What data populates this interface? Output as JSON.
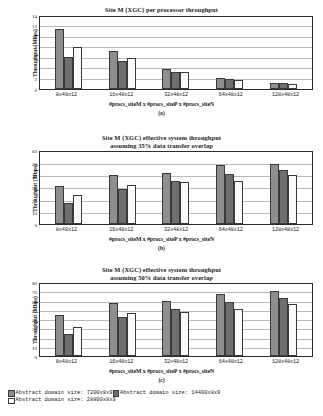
{
  "legend": {
    "items": [
      {
        "label": "Abstract domain size: 7200x8x9",
        "color": "#8e8e8e",
        "key": "series0"
      },
      {
        "label": "Abstract domain size: 14400x8x9",
        "color": "#6f6f6f",
        "key": "series1"
      },
      {
        "label": "Abstract domain size: 28800x8x9",
        "color": "#fbfbfb",
        "key": "series2"
      }
    ]
  },
  "panels": [
    {
      "caption": "(a)",
      "title_line1": "Site M (XGC) per processor throughput",
      "title_line2": ""
    },
    {
      "caption": "(b)",
      "title_line1": "Site M (XGC) effective system throughput",
      "title_line2": "assuming 35% data transfer overlap"
    },
    {
      "caption": "(c)",
      "title_line1": "Site M (XGC) effective system throughput",
      "title_line2": "assuming 50% data transfer overlap"
    }
  ],
  "chart_data": [
    {
      "type": "bar",
      "id": "a",
      "title": "Site M (XGC) per processor throughput",
      "subtitle": "",
      "caption": "(a)",
      "xlabel": "#procs_siteM x #procs_siteP x #procs_siteN",
      "ylabel": "Throughput (Mbps)",
      "categories": [
        "8x48x12",
        "16x48x12",
        "32x48x12",
        "64x48x12",
        "128x48x12"
      ],
      "ylim": [
        0,
        14
      ],
      "yticks": [
        0,
        2,
        4,
        6,
        8,
        10,
        12,
        14
      ],
      "grid": true,
      "legend_position": "below-figure",
      "series": [
        {
          "name": "Abstract domain size: 7200x8x9",
          "values": [
            11.6,
            7.3,
            3.9,
            2.1,
            1.1
          ]
        },
        {
          "name": "Abstract domain size: 14400x8x9",
          "values": [
            6.2,
            5.3,
            3.3,
            1.9,
            1.0
          ]
        },
        {
          "name": "Abstract domain size: 28800x8x9",
          "values": [
            8.0,
            6.0,
            3.2,
            1.7,
            0.9
          ]
        }
      ]
    },
    {
      "type": "bar",
      "id": "b",
      "title": "Site M (XGC) effective system throughput",
      "subtitle": "assuming 35% data transfer overlap",
      "caption": "(b)",
      "xlabel": "#procs_siteM x #procs_siteP x #procs_siteN",
      "ylabel": "Throughput (Mbps)",
      "categories": [
        "8x48x12",
        "16x48x12",
        "32x48x12",
        "64x48x12",
        "128x48x12"
      ],
      "ylim": [
        0,
        60
      ],
      "yticks": [
        0,
        10,
        20,
        30,
        40,
        50,
        60
      ],
      "grid": true,
      "legend_position": "below-figure",
      "series": [
        {
          "name": "Abstract domain size: 7200x8x9",
          "values": [
            32,
            41,
            42.5,
            49,
            50.5
          ]
        },
        {
          "name": "Abstract domain size: 14400x8x9",
          "values": [
            18,
            29.5,
            36,
            42,
            45
          ]
        },
        {
          "name": "Abstract domain size: 28800x8x9",
          "values": [
            24,
            33,
            35,
            36,
            41
          ]
        }
      ]
    },
    {
      "type": "bar",
      "id": "c",
      "title": "Site M (XGC) effective system throughput",
      "subtitle": "assuming 50% data transfer overlap",
      "caption": "(c)",
      "xlabel": "#procs_siteM x #procs_siteP x #procs_siteN",
      "ylabel": "Throughput (Mbps)",
      "categories": [
        "8x48x12",
        "16x48x12",
        "32x48x12",
        "64x48x12",
        "128x48x12"
      ],
      "ylim": [
        0,
        80
      ],
      "yticks": [
        0,
        10,
        20,
        30,
        40,
        50,
        60,
        70,
        80
      ],
      "grid": true,
      "legend_position": "below-figure",
      "series": [
        {
          "name": "Abstract domain size: 7200x8x9",
          "values": [
            46,
            59,
            61,
            69,
            72
          ]
        },
        {
          "name": "Abstract domain size: 14400x8x9",
          "values": [
            25,
            44,
            52,
            60,
            65
          ]
        },
        {
          "name": "Abstract domain size: 28800x8x9",
          "values": [
            32,
            48,
            49,
            52,
            58
          ]
        }
      ]
    }
  ]
}
